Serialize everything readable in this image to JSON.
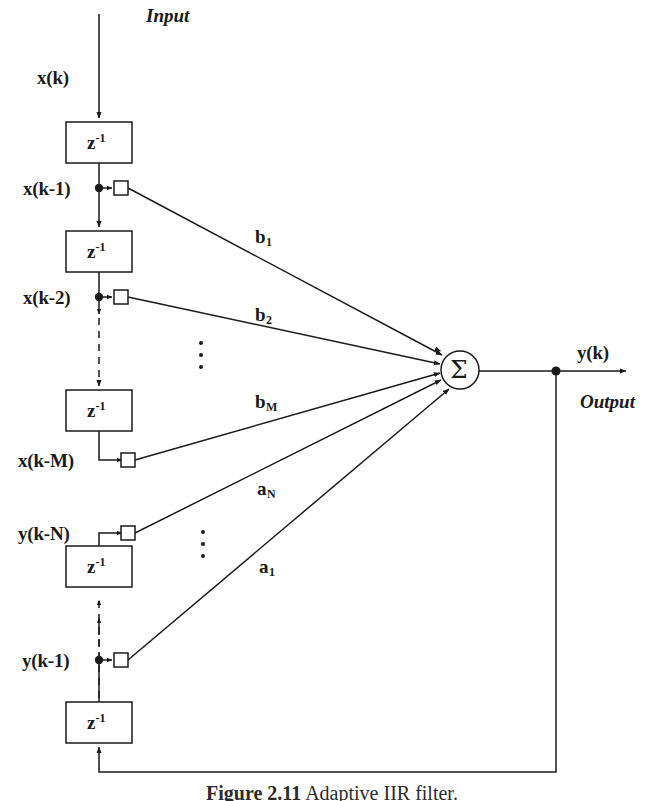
{
  "figure": {
    "caption_label": "Figure 2.11",
    "caption_text": "Adaptive IIR filter.",
    "input_label": "Input",
    "output_label": "Output",
    "input_signal": "x(k)",
    "output_signal": "y(k)",
    "delay_box_label": "z",
    "delay_box_exponent": "-1",
    "summing_node_symbol": "Σ",
    "ink_color": "#1a1a1a",
    "background_color": "#ffffff"
  },
  "feedforward": {
    "taps": [
      {
        "name": "x(k-1)",
        "coefficient": "b",
        "coefficient_sub": "1"
      },
      {
        "name": "x(k-2)",
        "coefficient": "b",
        "coefficient_sub": "2"
      },
      {
        "name": "x(k-M)",
        "coefficient": "b",
        "coefficient_sub": "M"
      }
    ]
  },
  "feedback": {
    "taps": [
      {
        "name": "y(k-N)",
        "coefficient": "a",
        "coefficient_sub": "N"
      },
      {
        "name": "y(k-1)",
        "coefficient": "a",
        "coefficient_sub": "1"
      }
    ]
  },
  "delay_blocks": [
    {
      "id": "x-delay-1"
    },
    {
      "id": "x-delay-2"
    },
    {
      "id": "x-delay-m"
    },
    {
      "id": "y-delay-n"
    },
    {
      "id": "y-delay-1"
    }
  ],
  "ellipsis_groups": [
    {
      "id": "forward-chain-ellipsis"
    },
    {
      "id": "coefficient-ellipsis-upper"
    },
    {
      "id": "coefficient-ellipsis-lower"
    }
  ]
}
